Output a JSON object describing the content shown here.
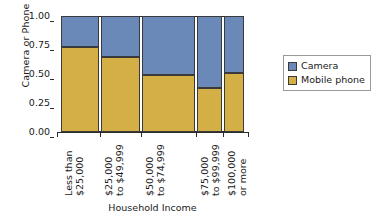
{
  "chart_data": {
    "type": "bar",
    "subtype": "stacked-proportional-mosaic",
    "title": "",
    "xlabel": "Household Income",
    "ylabel": "Camera or Phone",
    "categories": [
      "Less than $25,000",
      "$25,000 to $49,999",
      "$50,000 to $74,999",
      "$75,000 to $99,999",
      "$100,000 or more"
    ],
    "category_lines": [
      [
        "Less than",
        "$25,000"
      ],
      [
        "$25,000",
        "to $49,999"
      ],
      [
        "$50,000",
        "to $74,999"
      ],
      [
        "$75,000",
        "to $99,999"
      ],
      [
        "$100,000",
        "or more"
      ]
    ],
    "series": [
      {
        "name": "Camera",
        "color": "#6B89B8",
        "values": [
          0.27,
          0.35,
          0.51,
          0.62,
          0.49
        ]
      },
      {
        "name": "Mobile phone",
        "color": "#D4AF45",
        "values": [
          0.73,
          0.65,
          0.49,
          0.38,
          0.51
        ]
      }
    ],
    "category_widths": [
      0.206,
      0.212,
      0.287,
      0.14,
      0.107
    ],
    "ylim": [
      0.0,
      1.0
    ],
    "ytick_values": [
      0.0,
      0.25,
      0.5,
      0.75,
      1.0
    ],
    "ytick_labels": [
      "0.00",
      "0.25",
      "0.50",
      "0.75",
      "1.00"
    ],
    "grid": false,
    "legend_position": "right",
    "stack_order_top_to_bottom": [
      "Camera",
      "Mobile phone"
    ]
  },
  "axes": {
    "y_title": "Camera or Phone",
    "x_title": "Household Income"
  },
  "legend": {
    "entries": [
      {
        "label": "Camera",
        "color": "#6B89B8"
      },
      {
        "label": "Mobile phone",
        "color": "#D4AF45"
      }
    ]
  },
  "colors": {
    "camera": "#6B89B8",
    "mobile_phone": "#D4AF45",
    "axis": "#2b2b2b",
    "outline": "#3a3a3a",
    "legend_border": "#9a9a9a",
    "background": "#ffffff"
  }
}
